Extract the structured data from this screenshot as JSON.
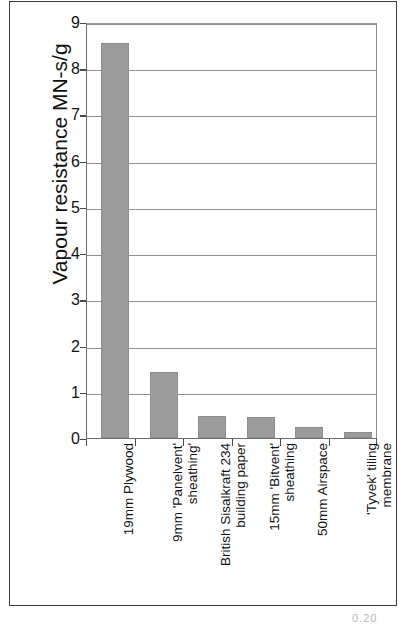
{
  "chart_data": {
    "type": "bar",
    "title": "",
    "xlabel": "",
    "ylabel": "Vapour resistance MN-s/g",
    "ylim": [
      0,
      9
    ],
    "ytick_step": 1,
    "yticks": [
      "9",
      "8",
      "7",
      "6",
      "5",
      "4",
      "3",
      "2",
      "1",
      "0"
    ],
    "grid": "horizontal",
    "legend": "none",
    "bar_color": "#9c9c9c",
    "categories": [
      "19mm Plywood",
      "9mm 'Panelvent' sheathing'",
      "British Sisalkraft 234 building paper",
      "15mm 'Bitvent' sheathing",
      "50mm Airspace",
      "'Tyvek' tiling membrane"
    ],
    "category_lines": [
      [
        "19mm Plywood",
        ""
      ],
      [
        "9mm 'Panelvent'",
        "sheathing'"
      ],
      [
        "British Sisalkraft 234",
        "building paper"
      ],
      [
        "15mm 'Bitvent'",
        "sheathing"
      ],
      [
        "50mm Airspace",
        ""
      ],
      [
        "'Tyvek' tiling",
        "membrane"
      ]
    ],
    "values": [
      8.55,
      1.43,
      0.48,
      0.45,
      0.23,
      0.13
    ]
  },
  "page": {
    "corner_number": "0.20"
  }
}
